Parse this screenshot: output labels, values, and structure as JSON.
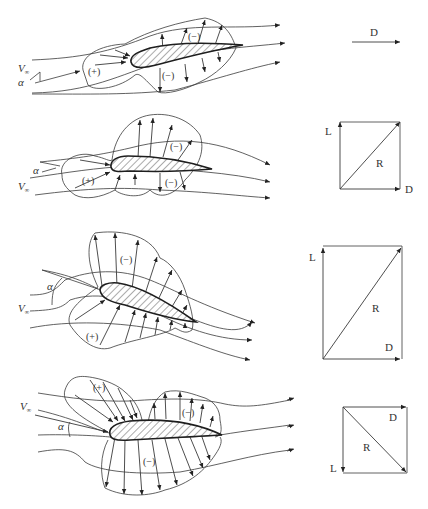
{
  "figure": {
    "panels": [
      {
        "id": "panel-1",
        "labels": {
          "velocity": "V",
          "velocity_sub": "∞",
          "angle": "α",
          "upper_region": "(−)",
          "lower_region": "(−)",
          "front_region": "(+)"
        },
        "force_diagram": {
          "drag": "D"
        }
      },
      {
        "id": "panel-2",
        "labels": {
          "velocity": "V",
          "velocity_sub": "∞",
          "angle": "α",
          "upper_region": "(−)",
          "lower_region": "(−)",
          "front_region": "(+)"
        },
        "force_diagram": {
          "lift": "L",
          "resultant": "R",
          "drag": "D"
        }
      },
      {
        "id": "panel-3",
        "labels": {
          "velocity": "V",
          "velocity_sub": "∞",
          "angle": "α",
          "upper_region": "(−)",
          "lower_region": "(+)"
        },
        "force_diagram": {
          "lift": "L",
          "resultant": "R",
          "drag": "D"
        }
      },
      {
        "id": "panel-4",
        "labels": {
          "velocity": "V",
          "velocity_sub": "∞",
          "angle": "α",
          "upper_front_region": "(+)",
          "upper_region": "(−)",
          "lower_region": "(−)"
        },
        "force_diagram": {
          "lift": "L",
          "resultant": "R",
          "drag": "D"
        }
      }
    ]
  }
}
